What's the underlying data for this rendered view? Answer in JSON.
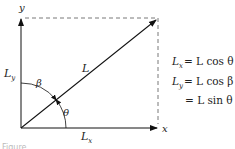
{
  "diagram": {
    "axes": {
      "x_label": "x",
      "y_label": "y"
    },
    "vector_label": "L",
    "component_labels": {
      "x": {
        "base": "L",
        "sub": "x"
      },
      "y": {
        "base": "L",
        "sub": "y"
      }
    },
    "angle_labels": {
      "theta": "θ",
      "beta": "β"
    },
    "equations": [
      {
        "lhs_base": "L",
        "lhs_sub": "x",
        "rhs": "= L cos θ"
      },
      {
        "lhs_base": "L",
        "lhs_sub": "y",
        "rhs": "= L cos β"
      },
      {
        "lhs_base": "",
        "lhs_sub": "",
        "rhs": "= L sin θ"
      }
    ],
    "caption": "Figure"
  }
}
